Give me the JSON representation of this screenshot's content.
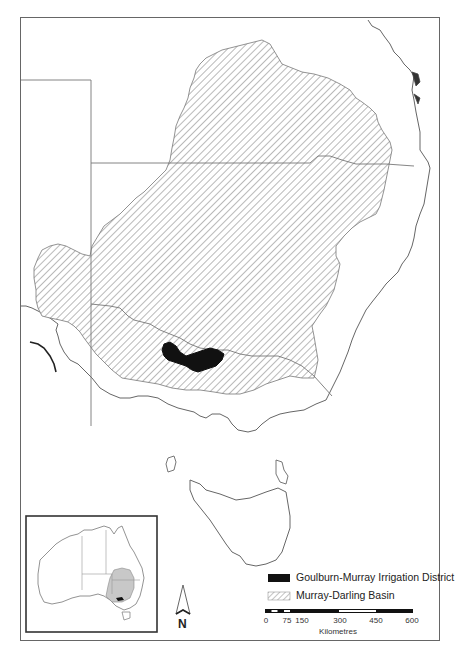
{
  "map": {
    "type": "study-area map",
    "region": "South-eastern Australia"
  },
  "legend": {
    "items": [
      {
        "label": "Goulburn-Murray Irrigation District",
        "symbol": "solid-black",
        "color": "#111111"
      },
      {
        "label": "Murray-Darling Basin",
        "symbol": "diagonal-hatch",
        "color": "#777777"
      }
    ]
  },
  "scale_bar": {
    "ticks": [
      "0",
      "75",
      "150",
      "300",
      "450",
      "600"
    ],
    "unit": "Kilometres"
  },
  "north_arrow": {
    "label": "N"
  },
  "inset": {
    "description": "Australia locator map with Murray-Darling Basin shaded",
    "basin_fill": "#c8c8c8"
  },
  "colors": {
    "frame": "#555555",
    "coast": "#666666",
    "hatch": "#8a8a8a",
    "irrigation": "#111111"
  }
}
